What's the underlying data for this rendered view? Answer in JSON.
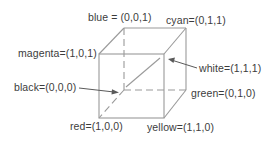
{
  "diagram": {
    "type": "rgb-color-cube",
    "line_color": "#9a9a9a",
    "text_color": "#3c3c3c",
    "background": "#ffffff",
    "vertices": [
      {
        "name": "blue",
        "label": "blue = (0,0,1)",
        "rgb": [
          0,
          0,
          1
        ]
      },
      {
        "name": "cyan",
        "label": "cyan=(0,1,1)",
        "rgb": [
          0,
          1,
          1
        ]
      },
      {
        "name": "magenta",
        "label": "magenta=(1,0,1)",
        "rgb": [
          1,
          0,
          1
        ]
      },
      {
        "name": "white",
        "label": "white=(1,1,1)",
        "rgb": [
          1,
          1,
          1
        ]
      },
      {
        "name": "black",
        "label": "black=(0,0,0)",
        "rgb": [
          0,
          0,
          0
        ]
      },
      {
        "name": "green",
        "label": "green=(0,1,0)",
        "rgb": [
          0,
          1,
          0
        ]
      },
      {
        "name": "red",
        "label": "red=(1,0,0)",
        "rgb": [
          1,
          0,
          0
        ]
      },
      {
        "name": "yellow",
        "label": "yellow=(1,1,0)",
        "rgb": [
          1,
          1,
          0
        ]
      }
    ],
    "edges_description": "Cube with front face (magenta, white, yellow, red), back face (blue, cyan, green, black); hidden edges from black vertex are dashed; a dashed/solid diagonal runs from black to white (grey axis).",
    "arrows": [
      {
        "from_label": "black",
        "points_to": "black vertex"
      },
      {
        "from_label": "white",
        "points_to": "white vertex"
      }
    ]
  }
}
